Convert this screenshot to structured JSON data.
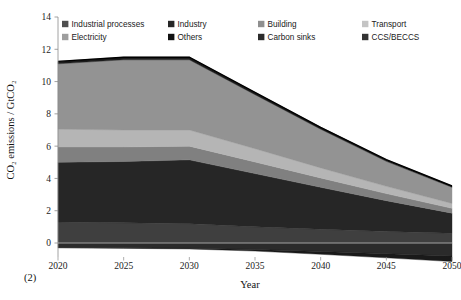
{
  "figure": {
    "label": "(2)"
  },
  "chart_data": {
    "type": "area",
    "stacked": true,
    "title": "",
    "xlabel": "Year",
    "ylabel": "CO₂ emissions / GtCO₂",
    "x": [
      2020,
      2025,
      2030,
      2035,
      2040,
      2045,
      2050
    ],
    "xlim": [
      2020,
      2050
    ],
    "ylim": [
      -1,
      14
    ],
    "xticks": [
      2020,
      2025,
      2030,
      2035,
      2040,
      2045,
      2050
    ],
    "xtick_labels": [
      "2020",
      "2025",
      "2030",
      "2035",
      "2040",
      "2045",
      "2050"
    ],
    "yticks": [
      0,
      2,
      4,
      6,
      8,
      10,
      12,
      14
    ],
    "ytick_labels": [
      "0",
      "2",
      "4",
      "6",
      "8",
      "10",
      "12",
      "14"
    ],
    "grid": false,
    "legend_position": "top-inside",
    "series": [
      {
        "name": "Others",
        "color": "#3f3f3f",
        "values": [
          1.3,
          1.25,
          1.2,
          1.0,
          0.85,
          0.72,
          0.6
        ]
      },
      {
        "name": "Industry",
        "color": "#262626",
        "values": [
          3.7,
          3.8,
          3.95,
          3.3,
          2.6,
          1.9,
          1.25
        ]
      },
      {
        "name": "Transport",
        "color": "#808080",
        "values": [
          0.95,
          0.9,
          0.85,
          0.72,
          0.58,
          0.44,
          0.3
        ]
      },
      {
        "name": "Building",
        "color": "#b5b5b5",
        "values": [
          1.1,
          1.05,
          1.0,
          0.82,
          0.62,
          0.45,
          0.3
        ]
      },
      {
        "name": "Electricity",
        "color": "#939393",
        "values": [
          4.05,
          4.35,
          4.35,
          3.35,
          2.4,
          1.55,
          1.0
        ]
      },
      {
        "name": "Industrial processes",
        "color": "#1c1c1c",
        "values": [
          0.15,
          0.16,
          0.16,
          0.14,
          0.12,
          0.1,
          0.08
        ]
      }
    ],
    "negative_series": [
      {
        "name": "Carbon sinks",
        "color": "#2b2b2b",
        "values": [
          -0.28,
          -0.3,
          -0.32,
          -0.4,
          -0.52,
          -0.66,
          -0.8
        ]
      },
      {
        "name": "CCS/BECCS",
        "color": "#1a1a1a",
        "values": [
          -0.02,
          -0.03,
          -0.05,
          -0.1,
          -0.18,
          -0.26,
          -0.35
        ]
      }
    ],
    "totals": [
      11.25,
      11.51,
      11.51,
      9.33,
      7.17,
      5.16,
      3.53
    ]
  },
  "legend": {
    "items": [
      {
        "label": "Industrial processes",
        "color": "#4f4f4f"
      },
      {
        "label": "Industry",
        "color": "#262626"
      },
      {
        "label": "Building",
        "color": "#8f8f8f"
      },
      {
        "label": "Transport",
        "color": "#c4c4c4"
      },
      {
        "label": "Electricity",
        "color": "#9e9e9e"
      },
      {
        "label": "Others",
        "color": "#111111"
      },
      {
        "label": "Carbon sinks",
        "color": "#2b2b2b"
      },
      {
        "label": "CCS/BECCS",
        "color": "#333333"
      }
    ]
  }
}
